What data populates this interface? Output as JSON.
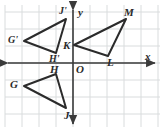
{
  "figure": {
    "kind": "coordinate-plane-diagram",
    "background_color": "#ffffff",
    "grid_color": "#d9dcdd",
    "axis_color": "#3a3a3a",
    "shape_color": "#2b2b2b",
    "label_color": "#2b2b2b",
    "grid_spacing_px": 17,
    "origin_px": {
      "x": 73,
      "y": 63
    },
    "plot_area_px": {
      "x": 5,
      "y": 5,
      "width": 155,
      "height": 122
    }
  },
  "axes": {
    "x_label": "x",
    "y_label": "y",
    "origin_label": "O",
    "x_axis": {
      "y_px": 63,
      "x_start_px": 8,
      "x_end_px": 155,
      "arrow_start": true,
      "arrow_end": true
    },
    "y_axis": {
      "x_px": 73,
      "y_start_px": 10,
      "y_end_px": 124,
      "arrow_start": true,
      "arrow_end": true
    }
  },
  "shapes": [
    {
      "name": "triangle-G-prime-J-prime-H-prime",
      "label": "G'J'H'",
      "closed": true,
      "points_px": [
        [
          24,
          41
        ],
        [
          66,
          19
        ],
        [
          56,
          53
        ]
      ],
      "vertices": [
        {
          "id": "G'",
          "x_px": 24,
          "y_px": 41
        },
        {
          "id": "J'",
          "x_px": 66,
          "y_px": 19
        },
        {
          "id": "H'",
          "x_px": 56,
          "y_px": 53
        }
      ]
    },
    {
      "name": "triangle-K-L-M",
      "label": "KLM",
      "closed": true,
      "points_px": [
        [
          74,
          45
        ],
        [
          108,
          56
        ],
        [
          126,
          19
        ]
      ],
      "vertices": [
        {
          "id": "K",
          "x_px": 74,
          "y_px": 45
        },
        {
          "id": "L",
          "x_px": 108,
          "y_px": 56
        },
        {
          "id": "M",
          "x_px": 126,
          "y_px": 19
        }
      ]
    },
    {
      "name": "triangle-G-H-J",
      "label": "GHJ",
      "closed": true,
      "points_px": [
        [
          24,
          86
        ],
        [
          56,
          74
        ],
        [
          66,
          108
        ]
      ],
      "vertices": [
        {
          "id": "G",
          "x_px": 24,
          "y_px": 86
        },
        {
          "id": "H",
          "x_px": 56,
          "y_px": 74
        },
        {
          "id": "J",
          "x_px": 66,
          "y_px": 108
        }
      ]
    }
  ],
  "point_labels": [
    {
      "id": "label-G-prime",
      "text": "G'",
      "x_px": 8,
      "y_px": 35
    },
    {
      "id": "label-J-prime",
      "text": "J'",
      "x_px": 59,
      "y_px": 6
    },
    {
      "id": "label-H-prime",
      "text": "H'",
      "x_px": 49,
      "y_px": 54
    },
    {
      "id": "label-K",
      "text": "K",
      "x_px": 63,
      "y_px": 40
    },
    {
      "id": "label-L",
      "text": "L",
      "x_px": 107,
      "y_px": 57
    },
    {
      "id": "label-M",
      "text": "M",
      "x_px": 124,
      "y_px": 7
    },
    {
      "id": "label-G",
      "text": "G",
      "x_px": 10,
      "y_px": 79
    },
    {
      "id": "label-H",
      "text": "H",
      "x_px": 50,
      "y_px": 64
    },
    {
      "id": "label-J",
      "text": "J",
      "x_px": 64,
      "y_px": 110
    },
    {
      "id": "label-O",
      "text": "O",
      "x_px": 76,
      "y_px": 64
    },
    {
      "id": "label-x-axis",
      "text": "x",
      "x_px": 145,
      "y_px": 51
    },
    {
      "id": "label-y-axis",
      "text": "y",
      "x_px": 78,
      "y_px": 7
    }
  ]
}
